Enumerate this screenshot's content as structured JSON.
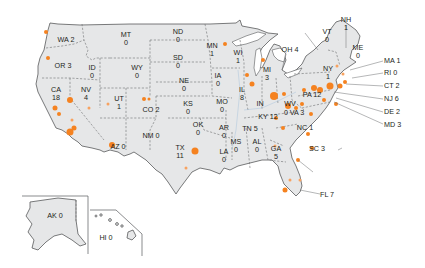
{
  "map": {
    "type": "choropleth-points",
    "region": "United States",
    "marker_color": "#f58220",
    "land_color": "#e6e7e8",
    "border_color": "#58595b",
    "states": [
      {
        "abbr": "WA",
        "count": 2,
        "label": "WA 2"
      },
      {
        "abbr": "OR",
        "count": 3,
        "label": "OR 3"
      },
      {
        "abbr": "CA",
        "count": 18,
        "label_line1": "CA",
        "label_line2": "18"
      },
      {
        "abbr": "NV",
        "count": 4,
        "label_line1": "NV",
        "label_line2": "4"
      },
      {
        "abbr": "ID",
        "count": 0,
        "label_line1": "ID",
        "label_line2": "0"
      },
      {
        "abbr": "MT",
        "count": 0,
        "label_line1": "MT",
        "label_line2": "0"
      },
      {
        "abbr": "WY",
        "count": 0,
        "label_line1": "WY",
        "label_line2": "0"
      },
      {
        "abbr": "UT",
        "count": 1,
        "label_line1": "UT",
        "label_line2": "1"
      },
      {
        "abbr": "CO",
        "count": 2,
        "label": "CO 2"
      },
      {
        "abbr": "AZ",
        "count": 0,
        "label": "AZ 0"
      },
      {
        "abbr": "NM",
        "count": 0,
        "label": "NM 0"
      },
      {
        "abbr": "ND",
        "count": 0,
        "label_line1": "ND",
        "label_line2": "0"
      },
      {
        "abbr": "SD",
        "count": 0,
        "label_line1": "SD",
        "label_line2": "0"
      },
      {
        "abbr": "NE",
        "count": 0,
        "label_line1": "NE",
        "label_line2": "0"
      },
      {
        "abbr": "KS",
        "count": 0,
        "label_line1": "KS",
        "label_line2": "0"
      },
      {
        "abbr": "OK",
        "count": 0,
        "label_line1": "OK",
        "label_line2": "0"
      },
      {
        "abbr": "TX",
        "count": 11,
        "label_line1": "TX",
        "label_line2": "11"
      },
      {
        "abbr": "MN",
        "count": 1,
        "label_line1": "MN",
        "label_line2": "1"
      },
      {
        "abbr": "IA",
        "count": 0,
        "label_line1": "IA",
        "label_line2": "0"
      },
      {
        "abbr": "MO",
        "count": 0,
        "label_line1": "MO",
        "label_line2": "0"
      },
      {
        "abbr": "AR",
        "count": 0,
        "label_line1": "AR",
        "label_line2": "0"
      },
      {
        "abbr": "LA",
        "count": 0,
        "label_line1": "LA",
        "label_line2": "0"
      },
      {
        "abbr": "WI",
        "count": 1,
        "label_line1": "WI",
        "label_line2": "1"
      },
      {
        "abbr": "IL",
        "count": 8,
        "label_line1": "IL",
        "label_line2": "8"
      },
      {
        "abbr": "MI",
        "count": 3,
        "label_line1": "MI",
        "label_line2": "3"
      },
      {
        "abbr": "IN",
        "count": null,
        "label": "IN"
      },
      {
        "abbr": "OH",
        "count": 4,
        "label": "OH 4"
      },
      {
        "abbr": "KY",
        "count": 12,
        "label": "KY 12"
      },
      {
        "abbr": "TN",
        "count": 5,
        "label": "TN 5"
      },
      {
        "abbr": "MS",
        "count": 0,
        "label_line1": "MS",
        "label_line2": "0"
      },
      {
        "abbr": "AL",
        "count": 0,
        "label_line1": "AL",
        "label_line2": "0"
      },
      {
        "abbr": "GA",
        "count": 5,
        "label_line1": "GA",
        "label_line2": "5"
      },
      {
        "abbr": "FL",
        "count": 7,
        "label": "FL 7"
      },
      {
        "abbr": "SC",
        "count": 3,
        "label": "SC 3"
      },
      {
        "abbr": "NC",
        "count": 1,
        "label": "NC 1"
      },
      {
        "abbr": "VA",
        "count": 3,
        "label": "VA 3"
      },
      {
        "abbr": "WV",
        "count": 0,
        "label_line1": "WV",
        "label_line2": "0"
      },
      {
        "abbr": "PA",
        "count": 12,
        "label": "PA 12"
      },
      {
        "abbr": "NY",
        "count": 1,
        "label_line1": "NY",
        "label_line2": "1"
      },
      {
        "abbr": "VT",
        "count": 0,
        "label_line1": "VT",
        "label_line2": "0"
      },
      {
        "abbr": "NH",
        "count": 1,
        "label_line1": "NH",
        "label_line2": "1"
      },
      {
        "abbr": "ME",
        "count": 0,
        "label_line1": "ME",
        "label_line2": "0"
      },
      {
        "abbr": "MA",
        "count": 1,
        "label": "MA 1"
      },
      {
        "abbr": "RI",
        "count": 0,
        "label": "RI 0"
      },
      {
        "abbr": "CT",
        "count": 2,
        "label": "CT 2"
      },
      {
        "abbr": "NJ",
        "count": 6,
        "label": "NJ 6"
      },
      {
        "abbr": "DE",
        "count": 2,
        "label": "DE 2"
      },
      {
        "abbr": "MD",
        "count": 3,
        "label": "MD 3"
      },
      {
        "abbr": "AK",
        "count": 0,
        "label": "AK 0"
      },
      {
        "abbr": "HI",
        "count": 0,
        "label": "HI 0"
      }
    ]
  },
  "labels": {
    "WA": "WA 2",
    "OR": "OR 3",
    "CA1": "CA",
    "CA2": "18",
    "NV1": "NV",
    "NV2": "4",
    "ID1": "ID",
    "ID2": "0",
    "MT1": "MT",
    "MT2": "0",
    "WY1": "WY",
    "WY2": "0",
    "UT1": "UT",
    "UT2": "1",
    "CO": "CO 2",
    "AZ": "AZ 0",
    "NM": "NM 0",
    "ND1": "ND",
    "ND2": "0",
    "SD1": "SD",
    "SD2": "0",
    "NE1": "NE",
    "NE2": "0",
    "KS1": "KS",
    "KS2": "0",
    "OK1": "OK",
    "OK2": "0",
    "TX1": "TX",
    "TX2": "11",
    "MN1": "MN",
    "MN2": "1",
    "IA1": "IA",
    "IA2": "0",
    "MO1": "MO",
    "MO2": "0",
    "AR1": "AR",
    "AR2": "0",
    "LA1": "LA",
    "LA2": "0",
    "WI1": "WI",
    "WI2": "1",
    "IL1": "IL",
    "IL2": "8",
    "MI1": "MI",
    "MI2": "3",
    "IN": "IN",
    "OH": "OH 4",
    "KY": "KY 12",
    "TN": "TN 5",
    "MS1": "MS",
    "MS2": "0",
    "AL1": "AL",
    "AL2": "0",
    "GA1": "GA",
    "GA2": "5",
    "FL": "FL 7",
    "SC": "SC 3",
    "NC": "NC 1",
    "VA": "VA 3",
    "WV1": "WV",
    "WV2": "0",
    "PA": "PA 12",
    "NY1": "NY",
    "NY2": "1",
    "VT1": "VT",
    "VT2": "0",
    "NH1": "NH",
    "NH2": "1",
    "ME1": "ME",
    "ME2": "0",
    "MA": "MA 1",
    "RI": "RI 0",
    "CT": "CT 2",
    "NJ": "NJ 6",
    "DE": "DE 2",
    "MD": "MD 3",
    "AK": "AK 0",
    "HI": "HI 0"
  }
}
